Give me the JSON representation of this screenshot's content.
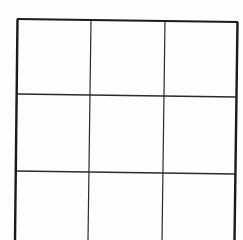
{
  "document": {
    "type": "blank-table-grid",
    "rows": 3,
    "columns": 3,
    "cells": [
      [
        "",
        "",
        ""
      ],
      [
        "",
        "",
        ""
      ],
      [
        "",
        "",
        ""
      ]
    ],
    "line_color": "#1a1a1a",
    "background_color": "#fdfdfd"
  }
}
